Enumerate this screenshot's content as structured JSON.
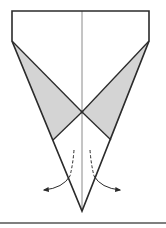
{
  "diagram": {
    "type": "origami-fold-step",
    "colors": {
      "background": "#ffffff",
      "outline": "#2b2b2b",
      "center_crease": "#8a8a8a",
      "shade": "#d4d4d4",
      "arrow": "#2b2b2b",
      "rule": "#555555"
    },
    "outline_points": [
      [
        12,
        11
      ],
      [
        149,
        11
      ],
      [
        149,
        41
      ],
      [
        82,
        211
      ],
      [
        12,
        41
      ]
    ],
    "center_crease": {
      "x": 82,
      "y1": 11,
      "y2": 211
    },
    "shaded_flaps": [
      {
        "side": "left",
        "points": [
          [
            12,
            41
          ],
          [
            82,
            112
          ],
          [
            53,
            140
          ]
        ]
      },
      {
        "side": "right",
        "points": [
          [
            149,
            41
          ],
          [
            82,
            112
          ],
          [
            111,
            140
          ]
        ]
      }
    ],
    "fold_lines": [
      {
        "from": [
          82,
          112
        ],
        "to": [
          53,
          140
        ]
      },
      {
        "from": [
          82,
          112
        ],
        "to": [
          111,
          140
        ]
      }
    ],
    "arrows": [
      {
        "side": "left",
        "dashed_from": [
          74,
          150
        ],
        "dashed_to": [
          70,
          176
        ],
        "curve_to": [
          42,
          190
        ],
        "icon": "fold-out-arrow-left"
      },
      {
        "side": "right",
        "dashed_from": [
          90,
          150
        ],
        "dashed_to": [
          94,
          176
        ],
        "curve_to": [
          122,
          190
        ],
        "icon": "fold-out-arrow-right"
      }
    ],
    "bottom_rule": {
      "y": 223,
      "x1": 0,
      "x2": 166
    }
  }
}
